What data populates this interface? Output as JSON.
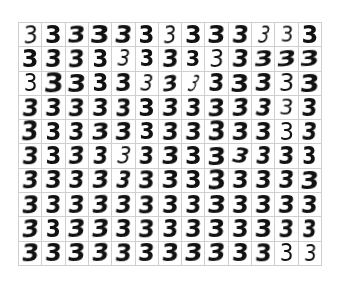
{
  "figure": {
    "rows": 10,
    "cols": 13,
    "digit_label": "3",
    "grid_line_color": "#cfcfcf",
    "ink_color": "#111111",
    "background_color": "#ffffff"
  },
  "cells": [
    {
      "text": "3",
      "w": 400,
      "rot": -4,
      "skew": -6,
      "sx": 0.95,
      "sy": 1.05,
      "size": 24
    },
    {
      "text": "3",
      "w": 700,
      "rot": 0,
      "skew": 0,
      "sx": 1.0,
      "sy": 1.0,
      "size": 24
    },
    {
      "text": "3",
      "w": 600,
      "rot": -2,
      "skew": -8,
      "sx": 1.1,
      "sy": 0.95,
      "size": 24
    },
    {
      "text": "3",
      "w": 900,
      "rot": 0,
      "skew": -4,
      "sx": 1.15,
      "sy": 1.0,
      "size": 25
    },
    {
      "text": "3",
      "w": 700,
      "rot": 2,
      "skew": -6,
      "sx": 1.05,
      "sy": 1.0,
      "size": 24
    },
    {
      "text": "3",
      "w": 600,
      "rot": 0,
      "skew": 0,
      "sx": 0.95,
      "sy": 1.0,
      "size": 24
    },
    {
      "text": "3",
      "w": 500,
      "rot": -3,
      "skew": -8,
      "sx": 0.85,
      "sy": 1.05,
      "size": 24
    },
    {
      "text": "3",
      "w": 700,
      "rot": 0,
      "skew": 0,
      "sx": 1.0,
      "sy": 1.0,
      "size": 24
    },
    {
      "text": "3",
      "w": 900,
      "rot": 0,
      "skew": -4,
      "sx": 1.1,
      "sy": 1.0,
      "size": 24
    },
    {
      "text": "3",
      "w": 800,
      "rot": 2,
      "skew": -6,
      "sx": 1.0,
      "sy": 1.0,
      "size": 24
    },
    {
      "text": "3",
      "w": 400,
      "rot": 6,
      "skew": -10,
      "sx": 0.7,
      "sy": 1.05,
      "size": 24
    },
    {
      "text": "3",
      "w": 500,
      "rot": 0,
      "skew": -4,
      "sx": 0.9,
      "sy": 0.95,
      "size": 22
    },
    {
      "text": "3",
      "w": 700,
      "rot": 0,
      "skew": 0,
      "sx": 1.0,
      "sy": 1.0,
      "size": 24
    },
    {
      "text": "3",
      "w": 700,
      "rot": 0,
      "skew": 0,
      "sx": 1.0,
      "sy": 1.0,
      "size": 24
    },
    {
      "text": "3",
      "w": 800,
      "rot": 0,
      "skew": -4,
      "sx": 1.0,
      "sy": 1.0,
      "size": 24
    },
    {
      "text": "3",
      "w": 900,
      "rot": -2,
      "skew": -6,
      "sx": 1.0,
      "sy": 1.05,
      "size": 24
    },
    {
      "text": "3",
      "w": 700,
      "rot": 0,
      "skew": 0,
      "sx": 0.95,
      "sy": 1.0,
      "size": 24
    },
    {
      "text": "3",
      "w": 500,
      "rot": 4,
      "skew": -8,
      "sx": 0.85,
      "sy": 1.0,
      "size": 23
    },
    {
      "text": "3",
      "w": 800,
      "rot": 0,
      "skew": 0,
      "sx": 0.9,
      "sy": 1.0,
      "size": 23
    },
    {
      "text": "3",
      "w": 700,
      "rot": -2,
      "skew": -6,
      "sx": 1.0,
      "sy": 1.0,
      "size": 24
    },
    {
      "text": "3",
      "w": 600,
      "rot": 0,
      "skew": 0,
      "sx": 0.9,
      "sy": 0.95,
      "size": 23
    },
    {
      "text": "3",
      "w": 500,
      "rot": 0,
      "skew": -4,
      "sx": 0.95,
      "sy": 1.0,
      "size": 24
    },
    {
      "text": "3",
      "w": 700,
      "rot": 2,
      "skew": -6,
      "sx": 1.0,
      "sy": 1.0,
      "size": 24
    },
    {
      "text": "3",
      "w": 800,
      "rot": -4,
      "skew": -10,
      "sx": 1.15,
      "sy": 0.9,
      "size": 24
    },
    {
      "text": "3",
      "w": 900,
      "rot": -6,
      "skew": -12,
      "sx": 1.2,
      "sy": 0.9,
      "size": 24
    },
    {
      "text": "3",
      "w": 900,
      "rot": -4,
      "skew": -8,
      "sx": 1.2,
      "sy": 0.85,
      "size": 24
    },
    {
      "text": "3",
      "w": 500,
      "rot": 0,
      "skew": 0,
      "sx": 0.9,
      "sy": 1.0,
      "size": 24
    },
    {
      "text": "3",
      "w": 900,
      "rot": 0,
      "skew": -4,
      "sx": 1.15,
      "sy": 1.05,
      "size": 25
    },
    {
      "text": "3",
      "w": 900,
      "rot": 0,
      "skew": -6,
      "sx": 1.1,
      "sy": 1.0,
      "size": 25
    },
    {
      "text": "3",
      "w": 600,
      "rot": 0,
      "skew": 0,
      "sx": 0.95,
      "sy": 1.0,
      "size": 24
    },
    {
      "text": "3",
      "w": 900,
      "rot": -2,
      "skew": -4,
      "sx": 1.0,
      "sy": 1.0,
      "size": 24
    },
    {
      "text": "3",
      "w": 400,
      "rot": 6,
      "skew": -8,
      "sx": 0.85,
      "sy": 1.0,
      "size": 23
    },
    {
      "text": "3",
      "w": 700,
      "rot": -10,
      "skew": -14,
      "sx": 1.0,
      "sy": 0.9,
      "size": 23
    },
    {
      "text": "3",
      "w": 400,
      "rot": 10,
      "skew": -14,
      "sx": 0.55,
      "sy": 1.05,
      "size": 23
    },
    {
      "text": "3",
      "w": 700,
      "rot": 0,
      "skew": -4,
      "sx": 0.95,
      "sy": 1.0,
      "size": 24
    },
    {
      "text": "3",
      "w": 900,
      "rot": 0,
      "skew": -4,
      "sx": 1.1,
      "sy": 1.0,
      "size": 25
    },
    {
      "text": "3",
      "w": 800,
      "rot": 0,
      "skew": -6,
      "sx": 1.05,
      "sy": 1.0,
      "size": 24
    },
    {
      "text": "3",
      "w": 500,
      "rot": 0,
      "skew": -4,
      "sx": 1.0,
      "sy": 1.0,
      "size": 24
    },
    {
      "text": "3",
      "w": 900,
      "rot": -2,
      "skew": -6,
      "sx": 1.15,
      "sy": 1.0,
      "size": 25
    },
    {
      "text": "3",
      "w": 800,
      "rot": 0,
      "skew": -6,
      "sx": 1.0,
      "sy": 1.05,
      "size": 24
    },
    {
      "text": "3",
      "w": 800,
      "rot": 0,
      "skew": -4,
      "sx": 1.0,
      "sy": 1.0,
      "size": 24
    },
    {
      "text": "3",
      "w": 900,
      "rot": 0,
      "skew": -6,
      "sx": 1.0,
      "sy": 1.05,
      "size": 24
    },
    {
      "text": "3",
      "w": 800,
      "rot": 0,
      "skew": -4,
      "sx": 1.0,
      "sy": 1.0,
      "size": 24
    },
    {
      "text": "3",
      "w": 900,
      "rot": 0,
      "skew": -4,
      "sx": 0.95,
      "sy": 1.05,
      "size": 24
    },
    {
      "text": "3",
      "w": 700,
      "rot": 0,
      "skew": 0,
      "sx": 1.0,
      "sy": 1.0,
      "size": 24
    },
    {
      "text": "3",
      "w": 700,
      "rot": -2,
      "skew": -8,
      "sx": 1.0,
      "sy": 1.0,
      "size": 24
    },
    {
      "text": "3",
      "w": 800,
      "rot": 0,
      "skew": -4,
      "sx": 0.95,
      "sy": 1.0,
      "size": 24
    },
    {
      "text": "3",
      "w": 900,
      "rot": -2,
      "skew": -6,
      "sx": 1.05,
      "sy": 1.05,
      "size": 24
    },
    {
      "text": "3",
      "w": 700,
      "rot": -4,
      "skew": -10,
      "sx": 1.05,
      "sy": 1.0,
      "size": 24
    },
    {
      "text": "3",
      "w": 600,
      "rot": 4,
      "skew": -8,
      "sx": 0.95,
      "sy": 1.0,
      "size": 24
    },
    {
      "text": "3",
      "w": 500,
      "rot": 2,
      "skew": -6,
      "sx": 0.95,
      "sy": 0.95,
      "size": 23
    },
    {
      "text": "3",
      "w": 800,
      "rot": 0,
      "skew": -4,
      "sx": 0.95,
      "sy": 1.0,
      "size": 24
    },
    {
      "text": "3",
      "w": 900,
      "rot": -2,
      "skew": -6,
      "sx": 1.0,
      "sy": 1.05,
      "size": 25
    },
    {
      "text": "3",
      "w": 700,
      "rot": 0,
      "skew": 0,
      "sx": 0.95,
      "sy": 1.0,
      "size": 24
    },
    {
      "text": "3",
      "w": 700,
      "rot": 0,
      "skew": -4,
      "sx": 0.95,
      "sy": 1.0,
      "size": 24
    },
    {
      "text": "3",
      "w": 700,
      "rot": -4,
      "skew": -8,
      "sx": 1.1,
      "sy": 0.95,
      "size": 24
    },
    {
      "text": "3",
      "w": 600,
      "rot": -2,
      "skew": -6,
      "sx": 1.05,
      "sy": 1.0,
      "size": 24
    },
    {
      "text": "3",
      "w": 600,
      "rot": 0,
      "skew": 0,
      "sx": 0.95,
      "sy": 1.0,
      "size": 23
    },
    {
      "text": "3",
      "w": 700,
      "rot": -2,
      "skew": -6,
      "sx": 1.0,
      "sy": 1.0,
      "size": 24
    },
    {
      "text": "3",
      "w": 800,
      "rot": 0,
      "skew": -4,
      "sx": 1.0,
      "sy": 1.0,
      "size": 24
    },
    {
      "text": "3",
      "w": 900,
      "rot": 0,
      "skew": -4,
      "sx": 1.05,
      "sy": 1.05,
      "size": 25
    },
    {
      "text": "3",
      "w": 800,
      "rot": -2,
      "skew": -6,
      "sx": 1.05,
      "sy": 1.0,
      "size": 24
    },
    {
      "text": "3",
      "w": 700,
      "rot": 0,
      "skew": -4,
      "sx": 1.0,
      "sy": 1.0,
      "size": 24
    },
    {
      "text": "3",
      "w": 500,
      "rot": 0,
      "skew": 0,
      "sx": 0.95,
      "sy": 1.0,
      "size": 24
    },
    {
      "text": "3",
      "w": 700,
      "rot": 2,
      "skew": -6,
      "sx": 0.9,
      "sy": 1.0,
      "size": 24
    },
    {
      "text": "3",
      "w": 900,
      "rot": 0,
      "skew": -6,
      "sx": 1.0,
      "sy": 1.05,
      "size": 24
    },
    {
      "text": "3",
      "w": 700,
      "rot": 0,
      "skew": 0,
      "sx": 0.95,
      "sy": 1.0,
      "size": 24
    },
    {
      "text": "3",
      "w": 600,
      "rot": -4,
      "skew": -10,
      "sx": 1.0,
      "sy": 1.0,
      "size": 24
    },
    {
      "text": "3",
      "w": 600,
      "rot": 0,
      "skew": -6,
      "sx": 0.9,
      "sy": 1.0,
      "size": 24
    },
    {
      "text": "3",
      "w": 500,
      "rot": 6,
      "skew": -10,
      "sx": 0.85,
      "sy": 1.0,
      "size": 24
    },
    {
      "text": "3",
      "w": 800,
      "rot": 0,
      "skew": -4,
      "sx": 0.9,
      "sy": 1.0,
      "size": 24
    },
    {
      "text": "3",
      "w": 900,
      "rot": -2,
      "skew": -6,
      "sx": 1.1,
      "sy": 1.0,
      "size": 24
    },
    {
      "text": "3",
      "w": 700,
      "rot": 0,
      "skew": 0,
      "sx": 1.0,
      "sy": 1.0,
      "size": 24
    },
    {
      "text": "3",
      "w": 900,
      "rot": -2,
      "skew": -4,
      "sx": 1.1,
      "sy": 1.0,
      "size": 25
    },
    {
      "text": "3",
      "w": 600,
      "rot": 8,
      "skew": -12,
      "sx": 1.0,
      "sy": 0.9,
      "size": 23
    },
    {
      "text": "3",
      "w": 600,
      "rot": 2,
      "skew": -6,
      "sx": 0.9,
      "sy": 1.0,
      "size": 24
    },
    {
      "text": "3",
      "w": 800,
      "rot": 0,
      "skew": -4,
      "sx": 0.95,
      "sy": 1.0,
      "size": 24
    },
    {
      "text": "3",
      "w": 600,
      "rot": 0,
      "skew": 0,
      "sx": 0.85,
      "sy": 1.0,
      "size": 24
    },
    {
      "text": "3",
      "w": 900,
      "rot": -2,
      "skew": -8,
      "sx": 1.0,
      "sy": 1.05,
      "size": 24
    },
    {
      "text": "3",
      "w": 800,
      "rot": 0,
      "skew": -4,
      "sx": 1.0,
      "sy": 1.0,
      "size": 24
    },
    {
      "text": "3",
      "w": 700,
      "rot": 0,
      "skew": -6,
      "sx": 0.95,
      "sy": 1.0,
      "size": 24
    },
    {
      "text": "3",
      "w": 800,
      "rot": -4,
      "skew": -10,
      "sx": 1.05,
      "sy": 1.0,
      "size": 24
    },
    {
      "text": "3",
      "w": 600,
      "rot": 4,
      "skew": -10,
      "sx": 0.85,
      "sy": 1.05,
      "size": 24
    },
    {
      "text": "3",
      "w": 900,
      "rot": 0,
      "skew": -4,
      "sx": 1.0,
      "sy": 1.05,
      "size": 24
    },
    {
      "text": "3",
      "w": 900,
      "rot": 0,
      "skew": -4,
      "sx": 1.05,
      "sy": 1.0,
      "size": 24
    },
    {
      "text": "3",
      "w": 700,
      "rot": 0,
      "skew": 0,
      "sx": 1.0,
      "sy": 1.0,
      "size": 24
    },
    {
      "text": "3",
      "w": 900,
      "rot": -2,
      "skew": -4,
      "sx": 1.1,
      "sy": 1.05,
      "size": 25
    },
    {
      "text": "3",
      "w": 700,
      "rot": 0,
      "skew": -4,
      "sx": 1.0,
      "sy": 1.0,
      "size": 24
    },
    {
      "text": "3",
      "w": 800,
      "rot": 0,
      "skew": -4,
      "sx": 1.0,
      "sy": 1.0,
      "size": 24
    },
    {
      "text": "3",
      "w": 700,
      "rot": 0,
      "skew": -6,
      "sx": 0.95,
      "sy": 1.0,
      "size": 24
    },
    {
      "text": "3",
      "w": 900,
      "rot": -2,
      "skew": -6,
      "sx": 1.1,
      "sy": 1.0,
      "size": 25
    },
    {
      "text": "3",
      "w": 900,
      "rot": -2,
      "skew": -8,
      "sx": 1.05,
      "sy": 1.05,
      "size": 24
    },
    {
      "text": "3",
      "w": 700,
      "rot": 0,
      "skew": -4,
      "sx": 0.95,
      "sy": 1.0,
      "size": 24
    },
    {
      "text": "3",
      "w": 800,
      "rot": -2,
      "skew": -8,
      "sx": 1.0,
      "sy": 1.0,
      "size": 24
    },
    {
      "text": "3",
      "w": 900,
      "rot": -4,
      "skew": -10,
      "sx": 1.05,
      "sy": 1.0,
      "size": 24
    },
    {
      "text": "3",
      "w": 800,
      "rot": -2,
      "skew": -8,
      "sx": 1.0,
      "sy": 1.0,
      "size": 24
    },
    {
      "text": "3",
      "w": 900,
      "rot": 0,
      "skew": -4,
      "sx": 1.0,
      "sy": 1.05,
      "size": 24
    },
    {
      "text": "3",
      "w": 800,
      "rot": 0,
      "skew": -4,
      "sx": 1.0,
      "sy": 1.0,
      "size": 24
    },
    {
      "text": "3",
      "w": 700,
      "rot": 0,
      "skew": -4,
      "sx": 0.95,
      "sy": 1.0,
      "size": 24
    },
    {
      "text": "3",
      "w": 900,
      "rot": 0,
      "skew": -6,
      "sx": 1.1,
      "sy": 1.0,
      "size": 25
    },
    {
      "text": "3",
      "w": 800,
      "rot": 0,
      "skew": -4,
      "sx": 1.0,
      "sy": 1.0,
      "size": 24
    },
    {
      "text": "3",
      "w": 900,
      "rot": 0,
      "skew": -4,
      "sx": 1.0,
      "sy": 1.0,
      "size": 24
    },
    {
      "text": "3",
      "w": 900,
      "rot": 0,
      "skew": -6,
      "sx": 1.0,
      "sy": 1.0,
      "size": 24
    },
    {
      "text": "3",
      "w": 800,
      "rot": 0,
      "skew": -4,
      "sx": 1.0,
      "sy": 1.0,
      "size": 24
    },
    {
      "text": "3",
      "w": 900,
      "rot": -4,
      "skew": -10,
      "sx": 1.05,
      "sy": 1.05,
      "size": 24
    },
    {
      "text": "3",
      "w": 600,
      "rot": 0,
      "skew": 0,
      "sx": 0.9,
      "sy": 1.0,
      "size": 24
    },
    {
      "text": "3",
      "w": 900,
      "rot": -4,
      "skew": -10,
      "sx": 1.1,
      "sy": 1.0,
      "size": 24
    },
    {
      "text": "3",
      "w": 900,
      "rot": -4,
      "skew": -10,
      "sx": 1.1,
      "sy": 1.0,
      "size": 24
    },
    {
      "text": "3",
      "w": 800,
      "rot": 0,
      "skew": -4,
      "sx": 1.0,
      "sy": 1.0,
      "size": 24
    },
    {
      "text": "3",
      "w": 900,
      "rot": 0,
      "skew": -4,
      "sx": 1.0,
      "sy": 1.05,
      "size": 24
    },
    {
      "text": "3",
      "w": 700,
      "rot": 0,
      "skew": -4,
      "sx": 0.95,
      "sy": 1.0,
      "size": 24
    },
    {
      "text": "3",
      "w": 800,
      "rot": 0,
      "skew": -4,
      "sx": 1.0,
      "sy": 1.0,
      "size": 24
    },
    {
      "text": "3",
      "w": 900,
      "rot": 0,
      "skew": -4,
      "sx": 1.05,
      "sy": 1.0,
      "size": 24
    },
    {
      "text": "3",
      "w": 800,
      "rot": 0,
      "skew": -4,
      "sx": 1.0,
      "sy": 1.0,
      "size": 24
    },
    {
      "text": "3",
      "w": 900,
      "rot": 0,
      "skew": -4,
      "sx": 1.05,
      "sy": 1.0,
      "size": 24
    },
    {
      "text": "3",
      "w": 900,
      "rot": 0,
      "skew": -6,
      "sx": 0.9,
      "sy": 1.05,
      "size": 24
    },
    {
      "text": "3",
      "w": 700,
      "rot": 0,
      "skew": -4,
      "sx": 0.85,
      "sy": 1.05,
      "size": 24
    },
    {
      "text": "3",
      "w": 900,
      "rot": -2,
      "skew": -8,
      "sx": 1.05,
      "sy": 1.05,
      "size": 24
    },
    {
      "text": "3",
      "w": 800,
      "rot": 0,
      "skew": -4,
      "sx": 1.0,
      "sy": 1.0,
      "size": 24
    },
    {
      "text": "3",
      "w": 900,
      "rot": -2,
      "skew": -6,
      "sx": 1.1,
      "sy": 1.0,
      "size": 24
    },
    {
      "text": "3",
      "w": 800,
      "rot": -4,
      "skew": -10,
      "sx": 1.05,
      "sy": 1.0,
      "size": 24
    },
    {
      "text": "3",
      "w": 900,
      "rot": 0,
      "skew": -6,
      "sx": 1.0,
      "sy": 1.05,
      "size": 24
    },
    {
      "text": "3",
      "w": 800,
      "rot": 0,
      "skew": -4,
      "sx": 1.0,
      "sy": 1.0,
      "size": 24
    },
    {
      "text": "3",
      "w": 900,
      "rot": -2,
      "skew": -6,
      "sx": 1.05,
      "sy": 1.0,
      "size": 24
    },
    {
      "text": "3",
      "w": 900,
      "rot": -2,
      "skew": -8,
      "sx": 1.1,
      "sy": 1.0,
      "size": 24
    },
    {
      "text": "3",
      "w": 700,
      "rot": -4,
      "skew": -10,
      "sx": 1.1,
      "sy": 1.0,
      "size": 24
    },
    {
      "text": "3",
      "w": 700,
      "rot": 0,
      "skew": -4,
      "sx": 1.0,
      "sy": 1.0,
      "size": 24
    },
    {
      "text": "3",
      "w": 900,
      "rot": 0,
      "skew": -4,
      "sx": 1.0,
      "sy": 1.05,
      "size": 24
    },
    {
      "text": "3",
      "w": 500,
      "rot": 0,
      "skew": 0,
      "sx": 0.9,
      "sy": 1.0,
      "size": 24
    },
    {
      "text": "3",
      "w": 400,
      "rot": 0,
      "skew": -4,
      "sx": 0.85,
      "sy": 1.0,
      "size": 23
    }
  ]
}
